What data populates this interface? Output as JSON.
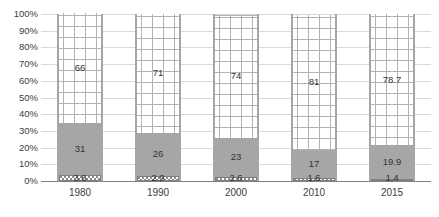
{
  "chart_data": {
    "type": "bar",
    "subtype": "stacked-100-percent",
    "title": "",
    "xlabel": "",
    "ylabel": "",
    "ylim": [
      0,
      100
    ],
    "ytick_labels": [
      "100%",
      "90%",
      "80%",
      "70%",
      "60%",
      "50%",
      "40%",
      "30%",
      "20%",
      "10%",
      "0%"
    ],
    "ytick_values": [
      100,
      90,
      80,
      70,
      60,
      50,
      40,
      30,
      20,
      10,
      0
    ],
    "grid": true,
    "legend": "none",
    "categories": [
      "1980",
      "1990",
      "2000",
      "2010",
      "2015"
    ],
    "series": [
      {
        "name": "bottom-series",
        "pattern": "checkered",
        "color": "#d9d9d9",
        "values": [
          3.6,
          2.9,
          2.6,
          1.6,
          1.4
        ],
        "labels": [
          "3.6",
          "2.9",
          "2.6",
          "1.6",
          "1.4"
        ]
      },
      {
        "name": "middle-series",
        "pattern": "solid",
        "color": "#a6a6a6",
        "values": [
          31,
          26,
          23,
          17,
          19.9
        ],
        "labels": [
          "31",
          "26",
          "23",
          "17",
          "19.9"
        ]
      },
      {
        "name": "top-series",
        "pattern": "grid",
        "color": "#ffffff",
        "values": [
          66,
          71,
          74,
          81,
          78.7
        ],
        "labels": [
          "66",
          "71",
          "74",
          "81",
          "78.7"
        ]
      }
    ]
  },
  "colors": {
    "bottom_fill": "#d9d9d9",
    "middle_fill": "#a6a6a6",
    "top_fill": "#ffffff",
    "bar_border": "#a6a6a6",
    "gridline": "#d9d9d9",
    "axis_line": "#808080",
    "label_text": "#404040"
  }
}
